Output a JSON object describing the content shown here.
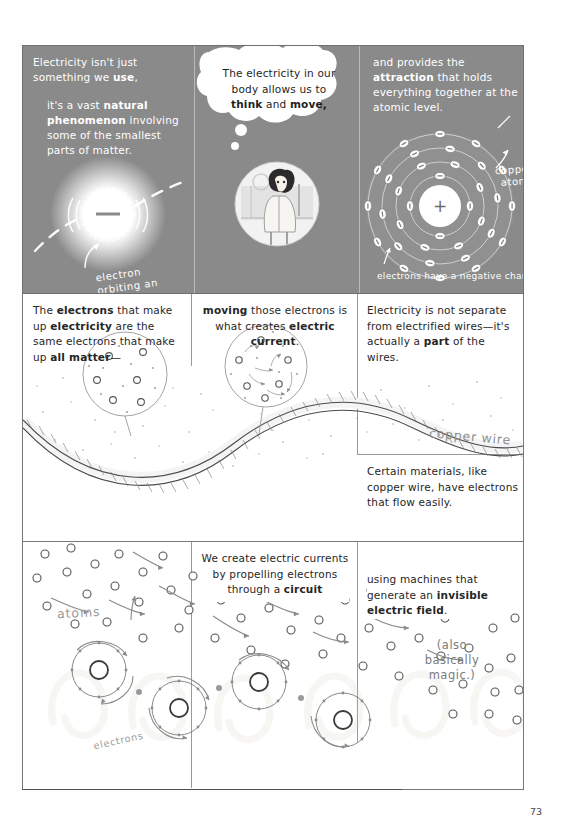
{
  "page": {
    "number": "73"
  },
  "row1": {
    "panel1": {
      "line1": "Electricity isn't just",
      "bold1": "something we ",
      "bold1b": "use",
      "line1_tail": ",",
      "line2": "it's a vast ",
      "bold2": "natural phenomenon",
      "line2_tail": " involving some of the smallest parts of matter.",
      "caption": "electron orbiting an atom",
      "electron_sign": "–"
    },
    "panel2": {
      "bubble_line1": "The electricity in our",
      "bubble_line2": "body allows us to",
      "bubble_bold1": "think",
      "bubble_and": " and ",
      "bubble_bold2": "move,",
      "figure_alt": "person standing"
    },
    "panel3": {
      "line1": "and provides the ",
      "bold1": "attraction",
      "line1_tail": " that holds everything together at the atomic level.",
      "label_atom": "copper\natom",
      "label_charge": "electrons have a negative charge",
      "nucleus_sign": "+"
    }
  },
  "row2": {
    "panel1": {
      "text_a": "The ",
      "bold_a": "electrons",
      "text_b": " that make up ",
      "bold_b": "electricity",
      "text_c": " are the same electrons that make up ",
      "bold_c": "all matter",
      "text_d": "—"
    },
    "panel2": {
      "bold_a": "moving",
      "text_a": " those electrons is what creates ",
      "bold_b": "electric current",
      "text_b": "."
    },
    "panel3": {
      "text_a": "Electricity is not separate from electrified wires—it's actually a ",
      "bold_a": "part",
      "text_b": " of the wires."
    },
    "panel4": {
      "text": "Certain materials, like copper wire, have electrons that flow easily."
    },
    "label_wire": "copper wire"
  },
  "row3": {
    "panel1": {
      "label_atoms": "atoms",
      "label_electrons": "electrons"
    },
    "panel2": {
      "text_a": "We create electric currents by propelling electrons through a ",
      "bold_a": "circuit"
    },
    "panel3": {
      "text_a": "using machines that generate an ",
      "bold_a": "invisible electric field",
      "text_b": ".",
      "aside": "(also basically magic.)"
    }
  },
  "colors": {
    "panel_dark": "#8a8a8a",
    "panel_light": "#ffffff",
    "ink": "#6b6b6b",
    "text_dark": "#262626",
    "text_light": "#ffffff"
  }
}
